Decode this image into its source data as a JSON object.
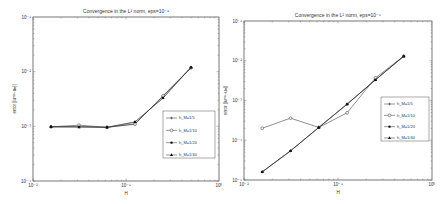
{
  "chart_data": [
    {
      "type": "line",
      "title": "Convergence in the L² norm, eps=10⁻¹",
      "xlabel": "H",
      "ylabel": "error ||uᵐˢ−uₕ||",
      "xscale": "log",
      "yscale": "log",
      "xlim": [
        0.01,
        1
      ],
      "ylim": [
        0.0001,
        0.1
      ],
      "xticks": [
        "10⁻²",
        "10⁻¹",
        "10⁰"
      ],
      "yticks": [
        "10⁻⁴",
        "10⁻³",
        "10⁻²",
        "10⁻¹"
      ],
      "grid": false,
      "legend_position": "right-middle",
      "x": [
        0.015625,
        0.03125,
        0.0625,
        0.125,
        0.25,
        0.5
      ],
      "series": [
        {
          "name": "h_M=1/5",
          "marker": "plus",
          "values": [
            0.00098,
            0.001,
            0.00096,
            0.0011,
            0.0036,
            0.0118
          ]
        },
        {
          "name": "h_M=1/10",
          "marker": "circle",
          "values": [
            0.00098,
            0.00105,
            0.00096,
            0.0011,
            0.0036,
            0.0118
          ]
        },
        {
          "name": "h_M=1/20",
          "marker": "dot",
          "values": [
            0.00098,
            0.00097,
            0.00096,
            0.0012,
            0.0033,
            0.012
          ]
        },
        {
          "name": "h_M=1/40",
          "marker": "triangle",
          "values": [
            0.00098,
            0.00097,
            0.00096,
            0.0012,
            0.0033,
            0.012
          ]
        }
      ]
    },
    {
      "type": "line",
      "title": "Convergence in the L² norm, eps=10⁻⁵",
      "xlabel": "H",
      "ylabel": "error ||uᵐˢ−uₕ||",
      "xscale": "log",
      "yscale": "log",
      "xlim": [
        0.01,
        1
      ],
      "ylim": [
        1e-05,
        0.1
      ],
      "xticks": [
        "10⁻²",
        "10⁻¹",
        "10⁰"
      ],
      "yticks": [
        "10⁻⁵",
        "10⁻⁴",
        "10⁻³",
        "10⁻²",
        "10⁻¹"
      ],
      "grid": false,
      "legend_position": "right-middle",
      "x": [
        0.015625,
        0.03125,
        0.0625,
        0.125,
        0.25,
        0.5
      ],
      "series": [
        {
          "name": "h_M=1/5",
          "marker": "plus",
          "values": [
            1.6e-05,
            5.4e-05,
            0.00021,
            0.00081,
            0.0033,
            0.013
          ]
        },
        {
          "name": "h_M=1/10",
          "marker": "circle",
          "values": [
            0.0002,
            0.00036,
            0.00021,
            0.00049,
            0.0037,
            0.013
          ]
        },
        {
          "name": "h_M=1/20",
          "marker": "dot",
          "values": [
            1.6e-05,
            5.4e-05,
            0.00021,
            0.00081,
            0.0033,
            0.013
          ]
        },
        {
          "name": "h_M=1/40",
          "marker": "triangle",
          "values": [
            1.6e-05,
            5.4e-05,
            0.00021,
            0.00081,
            0.0033,
            0.013
          ]
        }
      ]
    }
  ],
  "labels": {
    "left_title": "Convergence in the L² norm, eps=10⁻¹",
    "right_title": "Convergence in the L² norm, eps=10⁻⁵",
    "xlabel": "H",
    "ylabel": "error ||uᵐˢ−uₕ||",
    "legend": [
      "h_M=1/5",
      "h_M=1/10",
      "h_M=1/20",
      "h_M=1/40"
    ]
  },
  "colors": {
    "axis": "#555555",
    "line": "#333333",
    "text": "#333333",
    "background": "#ffffff"
  }
}
